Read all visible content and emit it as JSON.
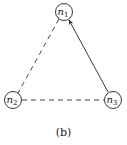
{
  "diagram": {
    "nodes": [
      {
        "id": "n1",
        "base": "n",
        "sub": "1",
        "x": 64,
        "y": 12
      },
      {
        "id": "n2",
        "base": "n",
        "sub": "2",
        "x": 13,
        "y": 100
      },
      {
        "id": "n3",
        "base": "n",
        "sub": "3",
        "x": 113,
        "y": 100
      }
    ],
    "edges": [
      {
        "from": "n1",
        "to": "n2",
        "style": "dashed",
        "directed": false
      },
      {
        "from": "n2",
        "to": "n3",
        "style": "dashed",
        "directed": false
      },
      {
        "from": "n3",
        "to": "n1",
        "style": "solid",
        "directed": true
      }
    ],
    "caption": "(b)"
  }
}
